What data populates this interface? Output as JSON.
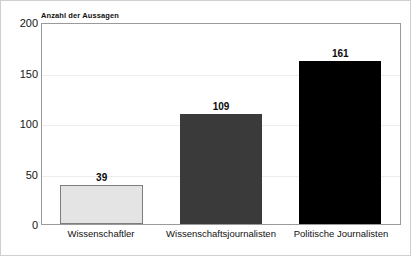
{
  "chart_data": {
    "type": "bar",
    "title": "",
    "xlabel": "",
    "ylabel": "Anzahl der Aussagen",
    "ylim": [
      0,
      200
    ],
    "yticks": [
      0,
      50,
      100,
      150,
      200
    ],
    "grid": true,
    "legend": "none",
    "categories": [
      "Wissenschaftler",
      "Wissenschaftsjournalisten",
      "Politische Journalisten"
    ],
    "values": [
      39,
      109,
      161
    ],
    "value_labels": [
      "39",
      "109",
      "161"
    ],
    "tick_labels": [
      "0",
      "50",
      "100",
      "150",
      "200"
    ],
    "bar_colors": [
      "#e4e4e4",
      "#3a3a3a",
      "#000000"
    ],
    "bar_border_colors": [
      "#7d7d7d",
      "#3a3a3a",
      "#000000"
    ]
  },
  "colors": {
    "plot_border": "#9a9a9a",
    "gridline": "#ededed",
    "text": "#111111",
    "background": "#ffffff"
  }
}
